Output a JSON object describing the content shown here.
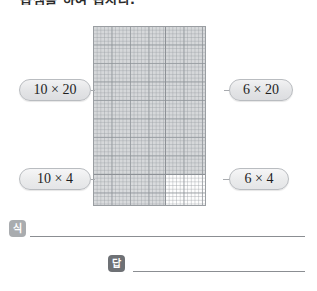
{
  "worksheet": {
    "title": "곱셈을 하여 봅시다.",
    "grid": {
      "quadrants": [
        {
          "name": "top-left",
          "label": "10 × 20",
          "shaded": true
        },
        {
          "name": "top-right",
          "label": "6 × 20",
          "shaded": true
        },
        {
          "name": "bottom-left",
          "label": "10 × 4",
          "shaded": true
        },
        {
          "name": "bottom-right",
          "label": "6 × 4",
          "shaded": false
        }
      ],
      "columns": [
        10,
        6
      ],
      "rows": [
        20,
        4
      ]
    },
    "labels": {
      "top_left": "10 × 20",
      "top_right": "6 × 20",
      "bottom_left": "10 × 4",
      "bottom_right": "6 × 4"
    },
    "answers": {
      "equation_badge": "식",
      "equation_value": "",
      "result_badge": "답",
      "result_value": ""
    }
  },
  "colors": {
    "grid_shaded": "#d6d8da",
    "grid_unshaded": "#fdfdfd",
    "grid_line": "#8d9196",
    "pill_border": "#b9bcc0",
    "badge_equation": "#a9acaf",
    "badge_result": "#6e7175"
  }
}
